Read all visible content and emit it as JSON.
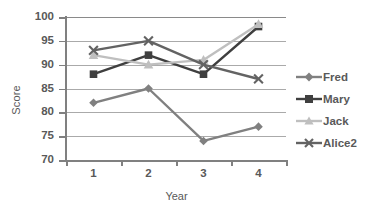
{
  "chart_data": {
    "type": "line",
    "title": "",
    "xlabel": "Year",
    "ylabel": "Score",
    "categories": [
      "1",
      "2",
      "3",
      "4"
    ],
    "ylim": [
      70,
      100
    ],
    "yticks": [
      70,
      75,
      80,
      85,
      90,
      95,
      100
    ],
    "grid": true,
    "legend_position": "right",
    "series": [
      {
        "name": "Fred",
        "values": [
          82,
          85,
          74,
          77
        ],
        "color": "#808080",
        "marker": "diamond"
      },
      {
        "name": "Mary",
        "values": [
          88,
          92,
          88,
          98
        ],
        "color": "#3f3f3f",
        "marker": "square"
      },
      {
        "name": "Jack",
        "values": [
          92,
          90,
          91,
          98.5
        ],
        "color": "#bfbfbf",
        "marker": "triangle"
      },
      {
        "name": "Alice2",
        "values": [
          93,
          95,
          90,
          87
        ],
        "color": "#636363",
        "marker": "x"
      }
    ]
  },
  "axes": {
    "y_tick_labels": [
      "100",
      "95",
      "90",
      "85",
      "80",
      "75",
      "70"
    ],
    "x_tick_labels": [
      "1",
      "2",
      "3",
      "4"
    ],
    "y_title": "Score",
    "x_title": "Year"
  },
  "legend": {
    "items": [
      {
        "label": "Fred"
      },
      {
        "label": "Mary"
      },
      {
        "label": "Jack"
      },
      {
        "label": "Alice2"
      }
    ]
  },
  "colors": {
    "fred": "#808080",
    "mary": "#3f3f3f",
    "jack": "#bfbfbf",
    "alice2": "#636363",
    "gridline": "#aaaaaa",
    "axis": "#808080",
    "text": "#595959",
    "background": "#ffffff"
  }
}
